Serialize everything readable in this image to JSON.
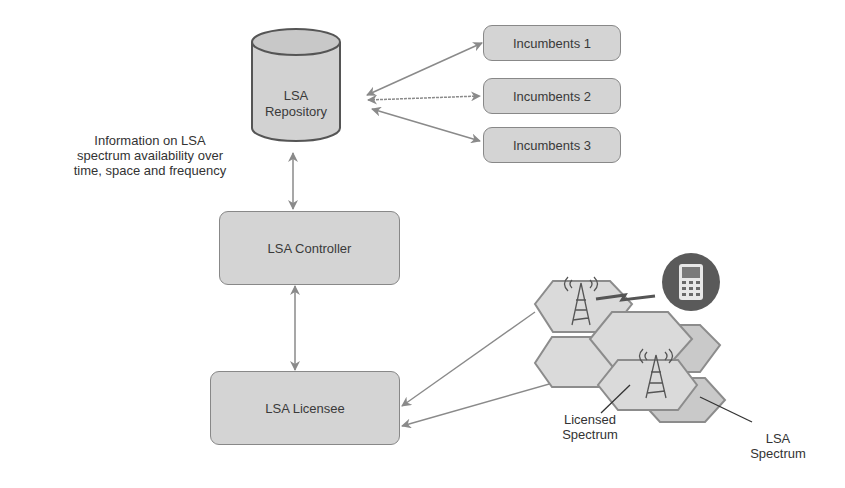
{
  "diagram": {
    "repository": {
      "line1": "LSA",
      "line2": "Repository"
    },
    "incumbents": [
      {
        "label": "Incumbents 1"
      },
      {
        "label": "Incumbents 2"
      },
      {
        "label": "Incumbents 3"
      }
    ],
    "info_note": {
      "line1": "Information on LSA",
      "line2": "spectrum availability over",
      "line3": "time, space and frequency"
    },
    "controller": {
      "label": "LSA Controller"
    },
    "licensee": {
      "label": "LSA Licensee"
    },
    "licensed_spectrum": {
      "line1": "Licensed",
      "line2": "Spectrum"
    },
    "lsa_spectrum": {
      "line1": "LSA",
      "line2": "Spectrum"
    },
    "icons": [
      "database-cylinder",
      "cell-tower-icon",
      "mobile-phone-icon",
      "lightning-link-icon"
    ],
    "colors": {
      "box_fill": "#d4d4d4",
      "box_border": "#888888",
      "arrow": "#8a8a8a",
      "hex_fill": "#d9d9d9",
      "hex_border": "#8c8c8c",
      "phone_circle": "#5a5a5a"
    }
  }
}
